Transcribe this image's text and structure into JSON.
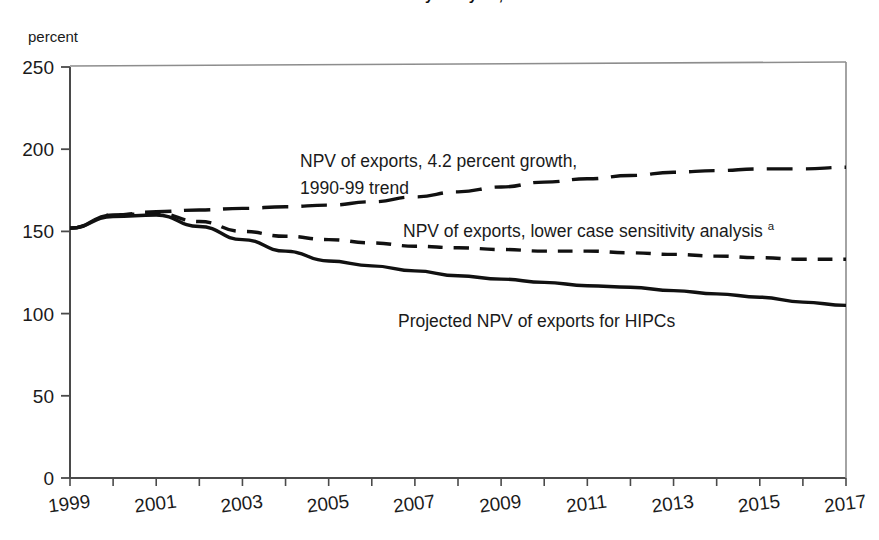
{
  "figure": {
    "title_partial": "debt sustainability analysis, 1999-2017",
    "y_axis_caption": "percent"
  },
  "chart_data": {
    "type": "line",
    "title": "debt sustainability analysis, 1999-2017",
    "xlabel": "",
    "ylabel": "percent",
    "ylim": [
      0,
      250
    ],
    "xlim": [
      1999,
      2017
    ],
    "yticks": [
      0,
      50,
      100,
      150,
      200,
      250
    ],
    "xticks": [
      1999,
      2001,
      2003,
      2005,
      2007,
      2009,
      2011,
      2013,
      2015,
      2017
    ],
    "grid": false,
    "legend_position": "inline-annotations",
    "x": [
      1999,
      2000,
      2001,
      2002,
      2003,
      2004,
      2005,
      2006,
      2007,
      2008,
      2009,
      2010,
      2011,
      2012,
      2013,
      2014,
      2015,
      2016,
      2017
    ],
    "series": [
      {
        "name": "NPV of exports, 4.2 percent growth, 1990-99 trend",
        "style": "long-dash",
        "values": [
          152,
          160,
          162,
          163,
          164,
          165,
          166,
          168,
          171,
          174,
          177,
          180,
          182,
          184,
          186,
          187,
          188,
          188,
          189
        ]
      },
      {
        "name": "NPV of exports, lower case sensitivity analysis",
        "style": "short-dash",
        "values": [
          152,
          160,
          161,
          156,
          150,
          147,
          145,
          143,
          141,
          140,
          139,
          138,
          138,
          137,
          136,
          135,
          134,
          133,
          133
        ]
      },
      {
        "name": "Projected NPV of exports for HIPCs",
        "style": "solid",
        "values": [
          152,
          159,
          160,
          153,
          145,
          138,
          132,
          129,
          126,
          123,
          121,
          119,
          117,
          116,
          114,
          112,
          110,
          107,
          105
        ]
      }
    ],
    "annotations": [
      {
        "id": "annotation-growth-trend",
        "line1": "NPV of exports, 4.2 percent growth,",
        "line2": "1990-99 trend"
      },
      {
        "id": "annotation-lower-case",
        "text": "NPV of exports, lower case sensitivity analysis",
        "footnote_marker": "a"
      },
      {
        "id": "annotation-projected-hipcs",
        "text": "Projected NPV of exports for HIPCs"
      }
    ],
    "ytick_labels": [
      "0",
      "50",
      "100",
      "150",
      "200",
      "250"
    ],
    "xtick_labels": [
      "1999",
      "2001",
      "2003",
      "2005",
      "2007",
      "2009",
      "2011",
      "2013",
      "2015",
      "2017"
    ],
    "colors": {
      "line": "#111111",
      "axis": "#4a4a4a",
      "background": "#ffffff"
    }
  }
}
